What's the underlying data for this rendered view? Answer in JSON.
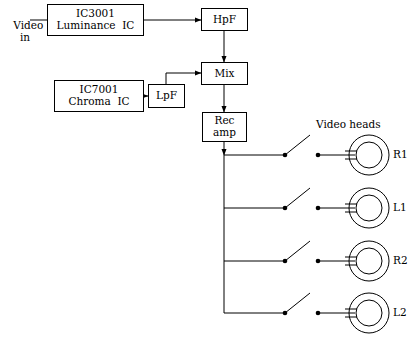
{
  "figure": {
    "background_color": "#ffffff",
    "line_color": "#000000"
  },
  "labels": {
    "video_in_line1": "Video",
    "video_in_line2": "in",
    "video_heads": "Video heads"
  },
  "blocks": [
    {
      "id": "luminance",
      "line1": "IC3001",
      "line2": "Luminance  IC",
      "x": 47,
      "y": 4,
      "w": 97,
      "h": 32
    },
    {
      "id": "chroma",
      "line1": "IC7001",
      "line2": "Chroma  IC",
      "x": 54,
      "y": 80,
      "w": 90,
      "h": 32
    },
    {
      "id": "lpf",
      "line1": "LpF",
      "line2": "",
      "x": 148,
      "y": 84,
      "w": 37,
      "h": 24
    },
    {
      "id": "hpf",
      "line1": "HpF",
      "line2": "",
      "x": 201,
      "y": 8,
      "w": 47,
      "h": 23
    },
    {
      "id": "mix",
      "line1": "Mix",
      "line2": "",
      "x": 201,
      "y": 62,
      "w": 47,
      "h": 23
    },
    {
      "id": "recamp",
      "line1": "Rec",
      "line2": "amp",
      "x": 202,
      "y": 112,
      "w": 45,
      "h": 30
    }
  ],
  "heads": [
    {
      "id": "r1",
      "label": "R1",
      "cy": 155
    },
    {
      "id": "l1",
      "label": "L1",
      "cy": 208
    },
    {
      "id": "r2",
      "label": "R2",
      "cy": 261
    },
    {
      "id": "l2",
      "label": "L2",
      "cy": 313
    }
  ],
  "switches": [
    {
      "id": "sw-r1",
      "state": "open",
      "cy": 155
    },
    {
      "id": "sw-l1",
      "state": "open",
      "cy": 208
    },
    {
      "id": "sw-r2",
      "state": "open",
      "cy": 261
    },
    {
      "id": "sw-l2",
      "state": "open",
      "cy": 313
    }
  ],
  "geometry": {
    "bus_x": 224,
    "bus_top": 155,
    "bus_bottom": 313,
    "switch_pivot_x": 285,
    "switch_blade_x": 310,
    "switch_blade_rise": 20,
    "switch_right_x": 318,
    "head_cx": 369,
    "head_outer_r": 20,
    "head_inner_r": 13,
    "head_lead_x": 330
  }
}
